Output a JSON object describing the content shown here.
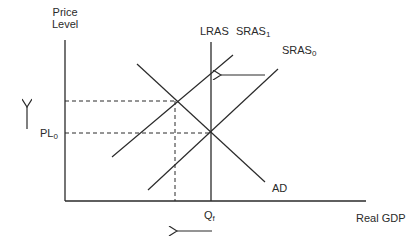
{
  "diagram": {
    "type": "AD-AS model",
    "y_axis_label_line1": "Price",
    "y_axis_label_line2": "Level",
    "x_axis_label": "Real GDP",
    "curves": {
      "lras": "LRAS",
      "sras1_main": "SRAS",
      "sras1_sub": "1",
      "sras0_main": "SRAS",
      "sras0_sub": "0",
      "ad": "AD"
    },
    "ticks": {
      "pl0_main": "PL",
      "pl0_sub": "0",
      "qf_main": "Q",
      "qf_sub": "f"
    },
    "arrows": {
      "price_level_change": "up",
      "sras_shift": "left",
      "real_gdp_change": "left"
    },
    "colors": {
      "line": "#2a2a2a",
      "background": "#ffffff"
    }
  }
}
